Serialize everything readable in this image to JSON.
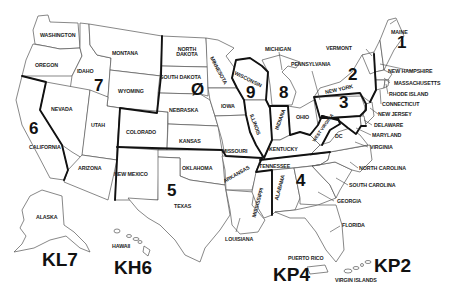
{
  "map": {
    "title": "US Amateur Radio Call District Map",
    "districts": [
      {
        "id": "1",
        "label": "1"
      },
      {
        "id": "2",
        "label": "2"
      },
      {
        "id": "3",
        "label": "3"
      },
      {
        "id": "4",
        "label": "4"
      },
      {
        "id": "5",
        "label": "5"
      },
      {
        "id": "6",
        "label": "6"
      },
      {
        "id": "7",
        "label": "7"
      },
      {
        "id": "8",
        "label": "8"
      },
      {
        "id": "9",
        "label": "9"
      },
      {
        "id": "0",
        "label": "Ø"
      }
    ],
    "prefixes": {
      "alaska": "KL7",
      "hawaii": "KH6",
      "puerto_rico": "KP4",
      "virgin_islands": "KP2"
    },
    "states": {
      "washington": "WASHINGTON",
      "oregon": "OREGON",
      "idaho": "IDAHO",
      "montana": "MONTANA",
      "wyoming": "WYOMING",
      "california": "CALIFORNIA",
      "nevada": "NEVADA",
      "utah": "UTAH",
      "arizona": "ARIZONA",
      "colorado": "COLORADO",
      "new_mexico": "NEW MEXICO",
      "north_dakota": "NORTH DAKOTA",
      "south_dakota": "SOUTH DAKOTA",
      "nebraska": "NEBRASKA",
      "kansas": "KANSAS",
      "oklahoma": "OKLAHOMA",
      "texas": "TEXAS",
      "minnesota": "MINNESOTA",
      "iowa": "IOWA",
      "missouri": "MISSOURI",
      "arkansas": "ARKANSAS",
      "louisiana": "LOUISIANA",
      "wisconsin": "WISCONSIN",
      "illinois": "ILLINOIS",
      "michigan": "MICHIGAN",
      "indiana": "INDIANA",
      "ohio": "OHIO",
      "kentucky": "KENTUCKY",
      "tennessee": "TENNESSEE",
      "mississippi": "MISSISSIPPI",
      "alabama": "ALABAMA",
      "georgia": "GEORGIA",
      "florida": "FLORIDA",
      "south_carolina": "SOUTH CAROLINA",
      "north_carolina": "NORTH CAROLINA",
      "virginia": "VIRGINIA",
      "west_virginia": "WEST VIRGINIA",
      "pennsylvania": "PENNSYLVANIA",
      "new_york": "NEW YORK",
      "vermont": "VERMONT",
      "maine": "MAINE",
      "new_hampshire": "NEW HAMPSHIRE",
      "massachusetts": "MASSACHUSETTS",
      "rhode_island": "RHODE ISLAND",
      "connecticut": "CONNECTICUT",
      "new_jersey": "NEW JERSEY",
      "delaware": "DELAWARE",
      "maryland": "MARYLAND",
      "dc": "DC",
      "alaska": "ALASKA",
      "hawaii": "HAWAII",
      "puerto_rico": "PUERTO RICO",
      "virgin_islands": "VIRGIN ISLANDS"
    }
  }
}
